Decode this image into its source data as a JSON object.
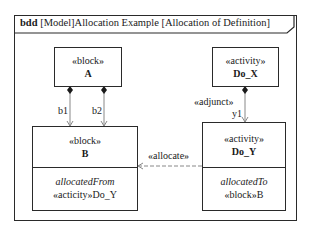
{
  "frame": {
    "kind": "bdd",
    "title": "[Model]Allocation Example [Allocation of Definition]"
  },
  "blocks": {
    "a": {
      "stereotype": "«block»",
      "name": "A"
    },
    "b": {
      "stereotype": "«block»",
      "name": "B",
      "compartment_label": "allocatedFrom",
      "compartment_value": "«acticity»Do_Y"
    },
    "do_x": {
      "stereotype": "«activity»",
      "name": "Do_X"
    },
    "do_y": {
      "stereotype": "«activity»",
      "name": "Do_Y",
      "compartment_label": "allocatedTo",
      "compartment_value": "«block»B"
    }
  },
  "relations": {
    "b1": "b1",
    "b2": "b2",
    "adjunct_stereotype": "«adjunct»",
    "y1": "y1",
    "allocate": "«allocate»"
  },
  "colors": {
    "line": "#2a2a2a",
    "connector": "#888888"
  }
}
